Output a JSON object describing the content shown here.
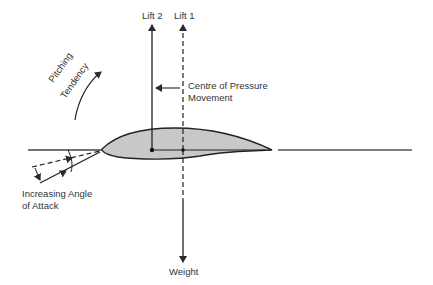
{
  "diagram": {
    "labels": {
      "lift2": "Lift 2",
      "lift1": "Lift 1",
      "cop_line1": "Centre of Pressure",
      "cop_line2": "Movement",
      "pitching_line1": "Pitching",
      "pitching_line2": "Tendency",
      "aoa_line1": "Increasing Angle",
      "aoa_line2": "of Attack",
      "weight": "Weight"
    },
    "colors": {
      "line": "#2a2a2a",
      "airfoil_fill": "#c8c8c8"
    }
  }
}
